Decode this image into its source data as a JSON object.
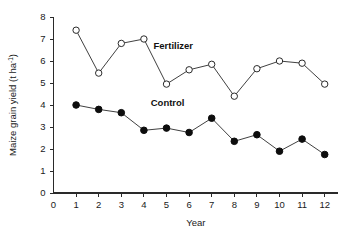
{
  "chart_data": {
    "type": "line",
    "title": "",
    "subtitle": "",
    "xlabel": "Year",
    "ylabel": "Maize grain yield (t ha⁻¹)",
    "ylabel_main": "Maize grain yield (t ha",
    "ylabel_sup": "-1",
    "ylabel_tail": ")",
    "x": [
      1,
      2,
      3,
      4,
      5,
      6,
      7,
      8,
      9,
      10,
      11,
      12
    ],
    "categories": [
      "1",
      "2",
      "3",
      "4",
      "5",
      "6",
      "7",
      "8",
      "9",
      "10",
      "11",
      "12"
    ],
    "xlim": [
      0,
      12.6
    ],
    "ylim": [
      0,
      8
    ],
    "xticks": [
      "0",
      "1",
      "2",
      "3",
      "4",
      "5",
      "6",
      "7",
      "8",
      "9",
      "10",
      "11",
      "12"
    ],
    "yticks": [
      "0",
      "1",
      "2",
      "3",
      "4",
      "5",
      "6",
      "7",
      "8"
    ],
    "grid": false,
    "legend_position": "inline-annotation",
    "series": [
      {
        "name": "Fertilizer",
        "marker": "open-circle",
        "values": [
          7.4,
          5.45,
          6.8,
          7.0,
          4.95,
          5.6,
          5.85,
          4.4,
          5.65,
          6.0,
          5.9,
          4.95
        ]
      },
      {
        "name": "Control",
        "marker": "filled-circle",
        "values": [
          4.0,
          3.8,
          3.65,
          2.85,
          2.95,
          2.75,
          3.4,
          2.35,
          2.65,
          1.9,
          2.45,
          1.75
        ]
      }
    ],
    "annotations": [
      {
        "text": "Fertilizer",
        "x": 5.3,
        "y": 6.55
      },
      {
        "text": "Control",
        "x": 5.05,
        "y": 3.95
      }
    ],
    "colors": {
      "axis": "#2a2a2a",
      "line": "#2a2a2a",
      "fertilizer_marker_fill": "#ffffff",
      "control_marker_fill": "#0d0d0d",
      "text": "#1a1a1a",
      "background": "#ffffff"
    }
  }
}
